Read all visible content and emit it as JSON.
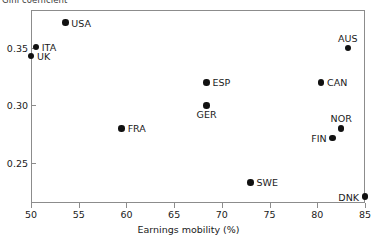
{
  "chart_data": {
    "type": "scatter",
    "title": "",
    "ylabel": "Gini coefficient",
    "xlabel": "Earnings mobility (%)",
    "xlim": [
      50,
      85
    ],
    "ylim": [
      0.215,
      0.383
    ],
    "grid": false,
    "legend": "none",
    "xticks": [
      "50",
      "55",
      "60",
      "65",
      "70",
      "75",
      "80",
      "85"
    ],
    "xtick_values": [
      50,
      55,
      60,
      65,
      70,
      75,
      80,
      85
    ],
    "yticks": [
      "0.35",
      "0.30",
      "0.25"
    ],
    "ytick_values": [
      0.35,
      0.3,
      0.25
    ],
    "marker_color": "#111111",
    "axis_color": "#8c8c8c",
    "points": [
      {
        "label": "USA",
        "x": 53.6,
        "y": 0.372,
        "label_pos": "right"
      },
      {
        "label": "ITA",
        "x": 50.5,
        "y": 0.351,
        "label_pos": "right"
      },
      {
        "label": "UK",
        "x": 50.0,
        "y": 0.343,
        "label_pos": "right"
      },
      {
        "label": "AUS",
        "x": 83.2,
        "y": 0.35,
        "label_pos": "above"
      },
      {
        "label": "ESP",
        "x": 68.4,
        "y": 0.32,
        "label_pos": "right"
      },
      {
        "label": "CAN",
        "x": 80.4,
        "y": 0.32,
        "label_pos": "right"
      },
      {
        "label": "GER",
        "x": 68.4,
        "y": 0.3,
        "label_pos": "below"
      },
      {
        "label": "NOR",
        "x": 82.5,
        "y": 0.28,
        "label_pos": "above"
      },
      {
        "label": "FRA",
        "x": 59.5,
        "y": 0.28,
        "label_pos": "right"
      },
      {
        "label": "FIN",
        "x": 81.6,
        "y": 0.2715,
        "label_pos": "left"
      },
      {
        "label": "SWE",
        "x": 73.0,
        "y": 0.233,
        "label_pos": "right"
      },
      {
        "label": "DNK",
        "x": 85.0,
        "y": 0.2205,
        "label_pos": "left"
      }
    ]
  }
}
